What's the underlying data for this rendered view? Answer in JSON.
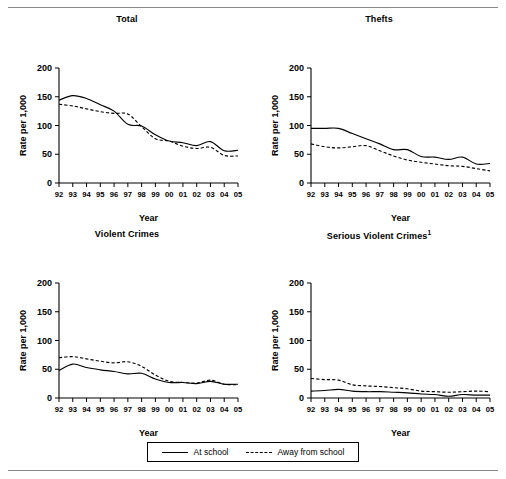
{
  "rules": {
    "top": "horizontal-rule",
    "bottom": "horizontal-rule"
  },
  "legend": {
    "items": [
      {
        "label": "At school",
        "style": "solid"
      },
      {
        "label": "Away from school",
        "style": "dashed"
      }
    ]
  },
  "chart_data": [
    {
      "type": "line",
      "title": "Total",
      "xlabel": "Year",
      "ylabel": "Rate per 1,000",
      "x": [
        "92",
        "93",
        "94",
        "95",
        "96",
        "97",
        "98",
        "99",
        "00",
        "01",
        "02",
        "03",
        "04",
        "05"
      ],
      "ylim": [
        0,
        200
      ],
      "yticks": [
        0,
        50,
        100,
        150,
        200
      ],
      "grid": false,
      "legend_position": "bottom",
      "series": [
        {
          "name": "At school",
          "style": "solid",
          "values": [
            144,
            152,
            147,
            136,
            125,
            102,
            99,
            84,
            73,
            70,
            65,
            72,
            56,
            57
          ]
        },
        {
          "name": "Away from school",
          "style": "dashed",
          "values": [
            137,
            134,
            129,
            124,
            121,
            120,
            98,
            77,
            73,
            64,
            60,
            62,
            48,
            47
          ]
        }
      ]
    },
    {
      "type": "line",
      "title": "Thefts",
      "title_footnote": "",
      "xlabel": "Year",
      "ylabel": "Rate per 1,000",
      "x": [
        "92",
        "93",
        "94",
        "95",
        "96",
        "97",
        "98",
        "99",
        "00",
        "01",
        "02",
        "03",
        "04",
        "05"
      ],
      "ylim": [
        0,
        200
      ],
      "yticks": [
        0,
        50,
        100,
        150,
        200
      ],
      "grid": false,
      "legend_position": "bottom",
      "series": [
        {
          "name": "At school",
          "style": "solid",
          "values": [
            95,
            95,
            95,
            86,
            77,
            68,
            58,
            58,
            46,
            45,
            41,
            45,
            33,
            34
          ]
        },
        {
          "name": "Away from school",
          "style": "dashed",
          "values": [
            68,
            63,
            61,
            63,
            65,
            56,
            47,
            40,
            36,
            33,
            30,
            29,
            25,
            21
          ]
        }
      ]
    },
    {
      "type": "line",
      "title": "Violent Crimes",
      "xlabel": "Year",
      "ylabel": "Rate per 1,000",
      "x": [
        "92",
        "93",
        "94",
        "95",
        "96",
        "97",
        "98",
        "99",
        "00",
        "01",
        "02",
        "03",
        "04",
        "05"
      ],
      "ylim": [
        0,
        200
      ],
      "yticks": [
        0,
        50,
        100,
        150,
        200
      ],
      "grid": false,
      "legend_position": "bottom",
      "series": [
        {
          "name": "At school",
          "style": "solid",
          "values": [
            48,
            59,
            53,
            49,
            46,
            42,
            43,
            33,
            27,
            27,
            25,
            29,
            24,
            24
          ]
        },
        {
          "name": "Away from school",
          "style": "dashed",
          "values": [
            70,
            72,
            68,
            64,
            61,
            63,
            55,
            40,
            29,
            27,
            26,
            31,
            24,
            23
          ]
        }
      ]
    },
    {
      "type": "line",
      "title": "Serious Violent Crimes",
      "title_footnote": "1",
      "xlabel": "Year",
      "ylabel": "Rate per 1,000",
      "x": [
        "92",
        "93",
        "94",
        "95",
        "96",
        "97",
        "98",
        "99",
        "00",
        "01",
        "02",
        "03",
        "04",
        "05"
      ],
      "ylim": [
        0,
        200
      ],
      "yticks": [
        0,
        50,
        100,
        150,
        200
      ],
      "grid": false,
      "legend_position": "bottom",
      "series": [
        {
          "name": "At school",
          "style": "solid",
          "values": [
            12,
            13,
            15,
            12,
            11,
            11,
            10,
            9,
            7,
            6,
            3,
            6,
            5,
            5
          ]
        },
        {
          "name": "Away from school",
          "style": "dashed",
          "values": [
            34,
            32,
            31,
            23,
            21,
            20,
            18,
            16,
            12,
            11,
            10,
            11,
            12,
            11
          ]
        }
      ]
    }
  ]
}
